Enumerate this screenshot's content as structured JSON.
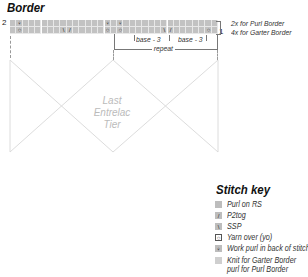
{
  "title": "Border",
  "row_labels": {
    "left": "2",
    "right": "1"
  },
  "row_notes": [
    "2x for Purl Border",
    "4x for Garter Border"
  ],
  "annotations": {
    "base_left": "base - 3",
    "base_right": "base - 3",
    "repeat": "repeat"
  },
  "tier_text": [
    "Last",
    "Entrelac",
    "Tier"
  ],
  "chart": {
    "columns": 33,
    "rows": 2,
    "background": "#c2c2c2",
    "row2_symbols": [
      {
        "col": 1,
        "symbol": "purl-tbl",
        "glyph": "♀"
      },
      {
        "col": 15,
        "symbol": "purl-tbl",
        "glyph": "♀"
      },
      {
        "col": 17,
        "symbol": "purl-tbl",
        "glyph": "♀"
      }
    ],
    "row1_symbols": [
      {
        "col": 1,
        "symbol": "yo",
        "glyph": "○"
      },
      {
        "col": 8,
        "symbol": "ssp",
        "glyph": "\\"
      },
      {
        "col": 9,
        "symbol": "p2tog",
        "glyph": "/"
      },
      {
        "col": 15,
        "symbol": "yo",
        "glyph": "○"
      },
      {
        "col": 17,
        "symbol": "yo",
        "glyph": "○"
      },
      {
        "col": 24,
        "symbol": "ssp",
        "glyph": "\\"
      },
      {
        "col": 25,
        "symbol": "p2tog",
        "glyph": "/"
      },
      {
        "col": 31,
        "symbol": "yo",
        "glyph": "○"
      }
    ]
  },
  "stitch_key": {
    "title": "Stitch key",
    "items": [
      {
        "icon": "purl-square-icon",
        "glyph": "",
        "label": "Purl on RS",
        "bg": "#bdbdbd"
      },
      {
        "icon": "p2tog-icon",
        "glyph": "/",
        "label": "P2tog",
        "bg": "#bdbdbd"
      },
      {
        "icon": "ssp-icon",
        "glyph": "\\",
        "label": "SSP",
        "bg": "#bdbdbd"
      },
      {
        "icon": "yarn-over-icon",
        "glyph": "○",
        "label": "Yarn over (yo)",
        "bg": "#ffffff"
      },
      {
        "icon": "purl-tbl-icon",
        "glyph": "♀",
        "label": "Work purl in back of stitch",
        "bg": "#bdbdbd"
      },
      {
        "icon": "garter-purl-icon",
        "glyph": "",
        "label": "Knit for Garter Border",
        "label2": "purl for Purl Border",
        "bg": "#cfcfcf"
      }
    ]
  }
}
